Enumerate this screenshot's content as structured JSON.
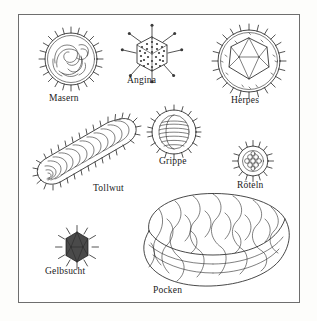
{
  "plate": {
    "title": "Virus shapes plate",
    "background_color": "#fdfdfb",
    "frame_color": "#6e6e6e",
    "ink_color": "#1b1b1b",
    "language": "de"
  },
  "figures": [
    {
      "id": "masern",
      "label": "Masern",
      "shape": "spiked enveloped sphere with coiled nucleocapsid",
      "x": 34,
      "y": 22,
      "size": 66,
      "label_x": 48,
      "label_y": 92
    },
    {
      "id": "angina",
      "label": "Angina",
      "shape": "hexagonal capsid with radiating knobbed fibers",
      "x": 122,
      "y": 24,
      "size": 56,
      "label_x": 128,
      "label_y": 76
    },
    {
      "id": "herpes",
      "label": "Herpes",
      "shape": "icosahedral capsid inside spiked envelope",
      "x": 212,
      "y": 22,
      "size": 70,
      "label_x": 232,
      "label_y": 96
    },
    {
      "id": "grippe",
      "label": "Grippe",
      "shape": "spiked sphere with coiled segments",
      "x": 148,
      "y": 102,
      "size": 48,
      "label_x": 158,
      "label_y": 155
    },
    {
      "id": "tollwut",
      "label": "Tollwut",
      "shape": "bullet shaped rod with helical coils and spikes",
      "x": 28,
      "y": 112,
      "size": 108,
      "label_x": 92,
      "label_y": 182
    },
    {
      "id": "roeteln",
      "label": "Röteln",
      "shape": "small spiked sphere with granular core",
      "x": 231,
      "y": 136,
      "size": 38,
      "label_x": 238,
      "label_y": 180
    },
    {
      "id": "gelbsucht",
      "label": "Gelbsucht",
      "shape": "dark spiked polyhedral particle",
      "x": 54,
      "y": 222,
      "size": 38,
      "label_x": 46,
      "label_y": 268
    },
    {
      "id": "pocken",
      "label": "Pocken",
      "shape": "large brick shaped virion with surface tubules",
      "x": 130,
      "y": 188,
      "size": 162,
      "label_x": 152,
      "label_y": 290
    }
  ]
}
